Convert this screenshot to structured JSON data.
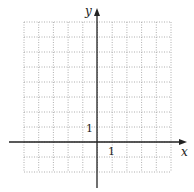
{
  "figure": {
    "type": "coordinate-grid",
    "x_axis_label": "x",
    "y_axis_label": "y",
    "x_tick_label": "1",
    "y_tick_label": "1",
    "grid": {
      "x_min": -5,
      "x_max": 5,
      "y_min": -2,
      "y_max": 8,
      "step": 1,
      "line_style": "dotted",
      "line_color": "#9a9a9a"
    },
    "axis_color": "#222222"
  }
}
